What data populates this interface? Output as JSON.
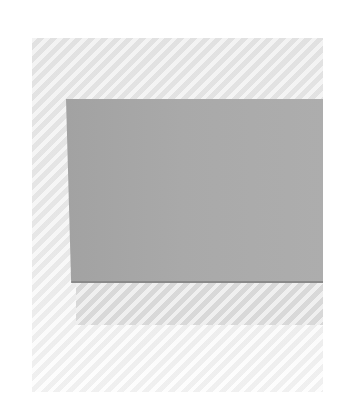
{
  "scene": {
    "description": "Photograph of a flat gray rectangular card on a light textured background",
    "colors": {
      "background": "#ffffff",
      "backdrop": "#e8e8e8",
      "card": "#a8a8a8",
      "card_edge": "#8a8a8a"
    }
  }
}
